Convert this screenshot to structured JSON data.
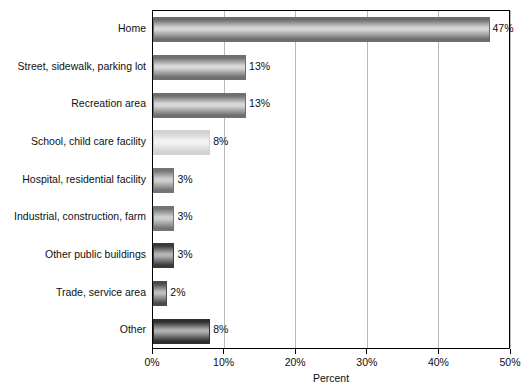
{
  "chart_data": {
    "type": "bar",
    "orientation": "horizontal",
    "title": "",
    "xlabel": "Percent",
    "ylabel": "",
    "xlim": [
      0,
      50
    ],
    "xticks": [
      "0%",
      "10%",
      "20%",
      "30%",
      "40%",
      "50%"
    ],
    "xtick_values": [
      0,
      10,
      20,
      30,
      40,
      50
    ],
    "grid": "vertical",
    "legend": "none",
    "categories": [
      "Home",
      "Street, sidewalk, parking lot",
      "Recreation area",
      "School, child care facility",
      "Hospital, residential facility",
      "Industrial, construction, farm",
      "Other public buildings",
      "Trade, service area",
      "Other"
    ],
    "values": [
      47,
      13,
      13,
      8,
      3,
      3,
      3,
      2,
      8
    ],
    "value_labels": [
      "47%",
      "13%",
      "13%",
      "8%",
      "3%",
      "3%",
      "3%",
      "2%",
      "8%"
    ],
    "bar_shades": [
      {
        "edge": "#6d6d6d",
        "mid": "#d6d6d6"
      },
      {
        "edge": "#6f6f6f",
        "mid": "#d8d8d8"
      },
      {
        "edge": "#6f6f6f",
        "mid": "#d8d8d8"
      },
      {
        "edge": "#d2d2d2",
        "mid": "#f3f3f3"
      },
      {
        "edge": "#747474",
        "mid": "#cfcfcf"
      },
      {
        "edge": "#747474",
        "mid": "#cfcfcf"
      },
      {
        "edge": "#3a3a3a",
        "mid": "#b4b4b4"
      },
      {
        "edge": "#4a4a4a",
        "mid": "#bdbdbd"
      },
      {
        "edge": "#2e2e2e",
        "mid": "#aeaeae"
      }
    ]
  }
}
